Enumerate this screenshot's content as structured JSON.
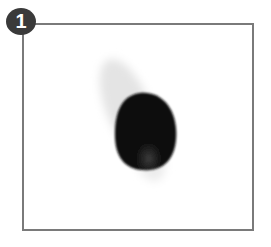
{
  "figure": {
    "step_number": "1",
    "colors": {
      "frame": "#7a7a7a",
      "badge": "#3a3a3a",
      "dark_object": "#111111",
      "shadow": "#e6e6e6"
    }
  }
}
